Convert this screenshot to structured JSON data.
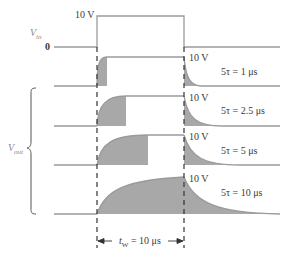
{
  "input": {
    "label": "V",
    "label_sub": "in",
    "high_label": "10 V",
    "low_label": "0"
  },
  "output": {
    "label": "V",
    "label_sub": "out",
    "traces": [
      {
        "amplitude_label": "10 V",
        "tau_label": "5τ = 1 μs"
      },
      {
        "amplitude_label": "10 V",
        "tau_label": "5τ = 2.5 μs"
      },
      {
        "amplitude_label": "10 V",
        "tau_label": "5τ = 5 μs"
      },
      {
        "amplitude_label": "10 V",
        "tau_label": "5τ = 10 μs"
      }
    ]
  },
  "pulse_width": {
    "label": "t",
    "label_sub": "W",
    "value": "= 10 μs"
  },
  "colors": {
    "line": "#9a9a9a",
    "fill": "#a8a8a8",
    "dash": "#333333"
  }
}
